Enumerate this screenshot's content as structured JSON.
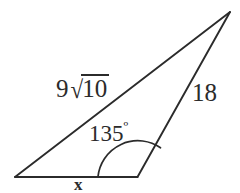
{
  "figure": {
    "kind": "geometry-diagram",
    "background_color": "#ffffff",
    "stroke_color": "#2b2b2b",
    "text_color": "#2b2b2b",
    "labels": {
      "side_left_coefficient": "9",
      "side_left_surd": "√",
      "side_left_radicand": "10",
      "side_left_full": "9√10",
      "side_right": "18",
      "angle": "135",
      "angle_unit": "º",
      "base_unknown": "x"
    },
    "geometry": {
      "vertices": {
        "bottom_left": [
          15,
          177
        ],
        "bottom_right": [
          137,
          177
        ],
        "apex": [
          230,
          12
        ]
      },
      "edges": [
        {
          "name": "base",
          "from": "bottom_left",
          "to": "bottom_right",
          "label": "x"
        },
        {
          "name": "long-side",
          "from": "bottom_left",
          "to": "apex",
          "label": "9√10"
        },
        {
          "name": "right-side",
          "from": "bottom_right",
          "to": "apex",
          "label": "18"
        }
      ],
      "angle_marker": {
        "at": "bottom_right",
        "value": "135º",
        "arc_start": [
          98,
          177
        ],
        "arc_end": [
          160,
          148
        ],
        "radius": 40
      }
    }
  }
}
